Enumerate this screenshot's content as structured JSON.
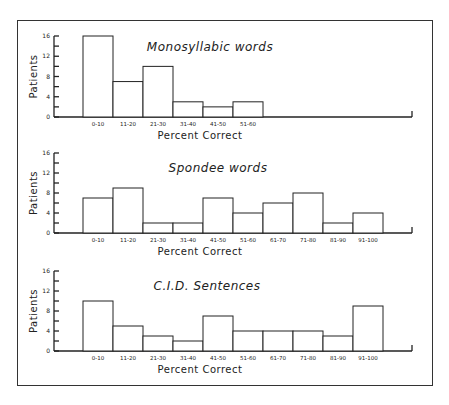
{
  "chart_data": [
    {
      "type": "bar",
      "title": "Monosyllabic words",
      "xlabel": "Percent Correct",
      "ylabel": "Patients",
      "ylim": [
        0,
        16
      ],
      "yticks": [
        0,
        4,
        8,
        12,
        16
      ],
      "categories": [
        "0-10",
        "11-20",
        "21-30",
        "31-40",
        "41-50",
        "51-60"
      ],
      "values": [
        16,
        7,
        10,
        3,
        2,
        3
      ],
      "grid": false
    },
    {
      "type": "bar",
      "title": "Spondee words",
      "xlabel": "Percent Correct",
      "ylabel": "Patients",
      "ylim": [
        0,
        16
      ],
      "yticks": [
        0,
        4,
        8,
        12,
        16
      ],
      "categories": [
        "0-10",
        "11-20",
        "21-30",
        "31-40",
        "41-50",
        "51-60",
        "61-70",
        "71-80",
        "81-90",
        "91-100"
      ],
      "values": [
        7,
        9,
        2,
        2,
        7,
        4,
        6,
        8,
        2,
        4
      ],
      "grid": false
    },
    {
      "type": "bar",
      "title": "C.I.D. Sentences",
      "xlabel": "Percent Correct",
      "ylabel": "Patients",
      "ylim": [
        0,
        16
      ],
      "yticks": [
        0,
        4,
        8,
        12,
        16
      ],
      "categories": [
        "0-10",
        "11-20",
        "21-30",
        "31-40",
        "41-50",
        "51-60",
        "61-70",
        "71-80",
        "81-90",
        "91-100"
      ],
      "values": [
        10,
        5,
        3,
        2,
        7,
        4,
        4,
        4,
        3,
        9
      ],
      "grid": false
    }
  ]
}
